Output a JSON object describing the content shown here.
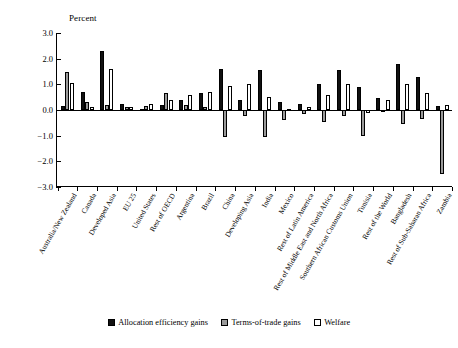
{
  "chart_data": {
    "type": "bar",
    "title": "",
    "xlabel": "",
    "ylabel": "Percent",
    "ylim": [
      -3.0,
      3.0
    ],
    "yticks": [
      3.0,
      2.0,
      1.0,
      0.0,
      -1.0,
      -2.0,
      -3.0
    ],
    "ytick_labels": [
      "3.0",
      "2.0",
      "1.0",
      "0.0",
      "-1.0",
      "-2.0",
      "-3.0"
    ],
    "grid": false,
    "legend_position": "bottom-center",
    "categories": [
      "Australia/New Zealand",
      "Canada",
      "Developed Asia",
      "EU 25",
      "United States",
      "Rest of OECD",
      "Argentina",
      "Brazil",
      "China",
      "Developing Asia",
      "India",
      "Mexico",
      "Rest of Latin America",
      "Rest of Middle East and North Africa",
      "Southern African Customs Union",
      "Tunisia",
      "Rest of the World",
      "Bangladesh",
      "Rest of Sub-Saharan Africa",
      "Zambia"
    ],
    "series": [
      {
        "name": "Allocation efficiency gains",
        "color": "#111111",
        "values": [
          0.15,
          0.7,
          2.3,
          0.25,
          0.05,
          0.2,
          0.4,
          0.65,
          1.6,
          0.4,
          1.55,
          0.3,
          0.25,
          1.0,
          1.55,
          0.9,
          0.45,
          1.8,
          1.3,
          0.15
        ]
      },
      {
        "name": "Terms-of-trade gains",
        "color": "#9a9a9a",
        "values": [
          1.5,
          0.3,
          0.2,
          0.1,
          0.15,
          0.65,
          0.2,
          0.1,
          -1.05,
          -0.25,
          -1.05,
          -0.4,
          -0.15,
          -0.45,
          -0.25,
          -1.0,
          -0.05,
          -0.55,
          -0.35,
          -2.5
        ]
      },
      {
        "name": "Welfare",
        "color": "#ffffff",
        "values": [
          1.05,
          0.1,
          1.6,
          0.1,
          0.25,
          0.4,
          0.6,
          0.7,
          0.95,
          1.0,
          0.5,
          0.05,
          0.1,
          0.6,
          1.0,
          -0.1,
          0.4,
          1.0,
          0.65,
          0.2
        ]
      }
    ]
  },
  "legend": {
    "items": [
      {
        "label": "Allocation efficiency gains"
      },
      {
        "label": "Terms-of-trade gains"
      },
      {
        "label": "Welfare"
      }
    ]
  }
}
